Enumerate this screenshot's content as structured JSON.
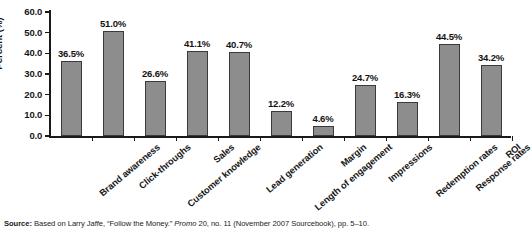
{
  "chart_data": {
    "type": "bar",
    "title": "",
    "xlabel": "",
    "ylabel": "Percent (%)",
    "ylim": [
      0.0,
      60.0
    ],
    "ytick_step": 10.0,
    "grid": false,
    "legend": "none",
    "bar_color": "#8d8d8d",
    "bar_edge_color": "#3a3a3a",
    "categories": [
      "Brand awareness",
      "Click-throughs",
      "Customer knowledge",
      "Sales",
      "Lead generation",
      "Length of engagement",
      "Margin",
      "Impressions",
      "Redemption rates",
      "Response rates",
      "ROI"
    ],
    "values": [
      36.5,
      51.0,
      26.6,
      41.1,
      40.7,
      12.2,
      4.6,
      24.7,
      16.3,
      44.5,
      34.2
    ],
    "value_labels": [
      "36.5%",
      "51.0%",
      "26.6%",
      "41.1%",
      "40.7%",
      "12.2%",
      "4.6%",
      "24.7%",
      "16.3%",
      "44.5%",
      "34.2%"
    ],
    "ytick_labels": [
      "0.0",
      "10.0",
      "20.0",
      "30.0",
      "40.0",
      "50.0",
      "60.0"
    ]
  },
  "source": {
    "prefix": "Source:",
    "text_part_1": " Based on Larry Jaffe, “Follow the Money.” ",
    "italic": "Promo",
    "text_part_2": " 20, no. 11 (November 2007 Sourcebook), pp. 5–10."
  }
}
